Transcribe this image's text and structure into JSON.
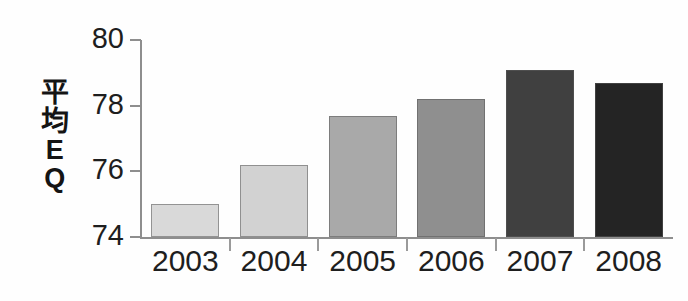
{
  "chart_data": {
    "type": "bar",
    "title": "",
    "subtitle": "",
    "xlabel": "",
    "ylabel": "平均EQ",
    "ylabel_lines": [
      "平",
      "均",
      "E",
      "Q"
    ],
    "categories": [
      "2003",
      "2004",
      "2005",
      "2006",
      "2007",
      "2008"
    ],
    "values": [
      75.0,
      76.2,
      77.7,
      78.2,
      79.1,
      78.7
    ],
    "series": [
      {
        "name": "平均EQ",
        "values": [
          75.0,
          76.2,
          77.7,
          78.2,
          79.1,
          78.7
        ]
      }
    ],
    "ylim": [
      74,
      80
    ],
    "yticks": [
      74,
      76,
      78,
      80
    ],
    "ytick_labels": [
      "74",
      "76",
      "78",
      "80"
    ],
    "grid": false,
    "legend": false,
    "legend_position": "none",
    "bar_colors": [
      "#d9d9d9",
      "#d2d2d2",
      "#a9a9a9",
      "#8f8f8f",
      "#404040",
      "#242424"
    ],
    "bar_border_color": "#5a5a5a",
    "axis_color": "#8e8e8e",
    "text_color": "#1e1e1e",
    "background": "#ffffff"
  },
  "accessibility": {
    "description": "平均EQ の棒グラフ 2003年から2008年"
  }
}
